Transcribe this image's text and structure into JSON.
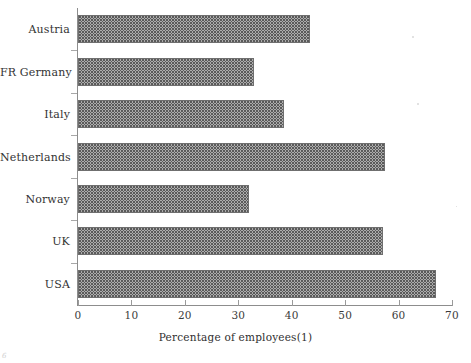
{
  "chart_data": {
    "type": "bar",
    "orientation": "horizontal",
    "title": "",
    "xlabel": "Percentage of  employees(1)",
    "ylabel": "",
    "categories": [
      "Austria",
      "FR Germany",
      "Italy",
      "Netherlands",
      "Norway",
      "UK",
      "USA"
    ],
    "values": [
      43.5,
      33,
      38.5,
      57.5,
      32,
      57,
      67
    ],
    "xlim": [
      0,
      70
    ],
    "xticks": [
      0,
      10,
      20,
      30,
      40,
      50,
      60,
      70
    ],
    "xtick_labels": [
      "0",
      "10",
      "20",
      "30",
      "40",
      "50",
      "60",
      "70"
    ],
    "grid": false,
    "legend": false,
    "bar_fill": "stipple-dot-pattern",
    "bar_border_color": "#6f6f6f",
    "axis_color": "#8d8d8d"
  },
  "axis": {
    "x_title": "Percentage of  employees(1)",
    "tick_labels": [
      "0",
      "10",
      "20",
      "30",
      "40",
      "50",
      "60",
      "70"
    ]
  },
  "categories": [
    {
      "label": "Austria",
      "value": 43.5
    },
    {
      "label": "FR Germany",
      "value": 33
    },
    {
      "label": "Italy",
      "value": 38.5
    },
    {
      "label": "Netherlands",
      "value": 57.5
    },
    {
      "label": "Norway",
      "value": 32
    },
    {
      "label": "UK",
      "value": 57
    },
    {
      "label": "USA",
      "value": 67
    }
  ],
  "scan": {
    "corner_mark": "6"
  }
}
